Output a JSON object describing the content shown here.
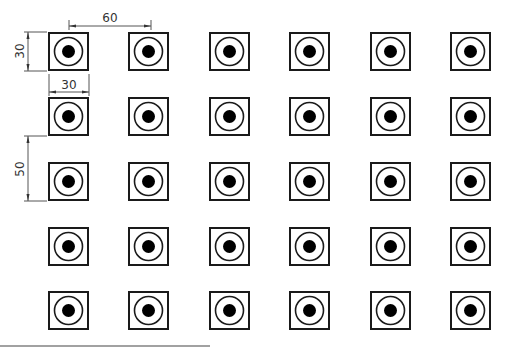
{
  "drawing": {
    "grid": {
      "rows": 5,
      "cols": 6,
      "col_x": [
        48,
        128,
        209,
        289,
        370,
        450
      ],
      "row_y": [
        32,
        97,
        162,
        227,
        291
      ],
      "square_w": 41,
      "square_h": 39,
      "ring_radius": 14,
      "dot_radius": 6.5
    },
    "dimensions": {
      "horizontal_pitch": {
        "label": "60",
        "x1": 69,
        "x2": 151,
        "y": 26
      },
      "vertical_size": {
        "label": "30",
        "x": 28,
        "y1": 32,
        "y2": 71
      },
      "horizontal_size": {
        "label": "30",
        "x1": 48,
        "x2": 89,
        "y": 93
      },
      "vertical_pitch": {
        "label": "50",
        "x": 28,
        "y1": 136,
        "y2": 201
      }
    },
    "colors": {
      "stroke": "#1a1a1a",
      "dim_line": "#555555",
      "fill_dot": "#000000",
      "background": "#ffffff"
    },
    "base_line": {
      "x1": 0,
      "x2": 210,
      "y": 346
    }
  }
}
